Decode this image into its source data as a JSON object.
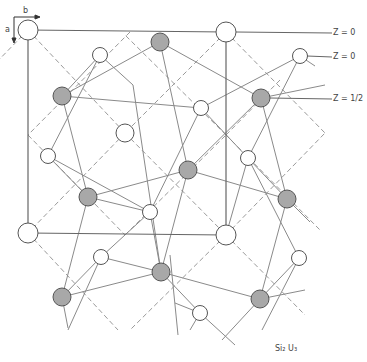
{
  "figure": {
    "title_display": "Si₂ U₃",
    "axes": {
      "a_label": "a",
      "b_label": "b"
    },
    "layer_labels": [
      {
        "text": "Z = 0",
        "y": 33
      },
      {
        "text": "Z = 0",
        "y": 57
      },
      {
        "text": "Z = 1/2",
        "y": 99
      }
    ],
    "unit_cell": {
      "x0": 28,
      "y0": 30,
      "x1": 226,
      "y1": 235
    },
    "colors": {
      "open_atom_fill": "#ffffff",
      "shaded_atom_fill": "#a8a8a8",
      "stroke": "#555555",
      "bond": "#888888",
      "dashed": "#9a9a9a"
    },
    "atoms": {
      "large_open": [
        [
          28,
          30
        ],
        [
          226,
          32
        ],
        [
          28,
          233
        ],
        [
          226,
          235
        ]
      ],
      "medium_open": [
        [
          125,
          133
        ]
      ],
      "small_open": [
        [
          100,
          55
        ],
        [
          300,
          56
        ],
        [
          201,
          108
        ],
        [
          48,
          156
        ],
        [
          248,
          158
        ],
        [
          150,
          212
        ],
        [
          299,
          258
        ],
        [
          101,
          257
        ],
        [
          200,
          313
        ]
      ],
      "shaded": [
        [
          160,
          42
        ],
        [
          62,
          96
        ],
        [
          261,
          98
        ],
        [
          188,
          170
        ],
        [
          88,
          197
        ],
        [
          287,
          199
        ],
        [
          161,
          272
        ],
        [
          62,
          297
        ],
        [
          260,
          299
        ]
      ]
    }
  }
}
